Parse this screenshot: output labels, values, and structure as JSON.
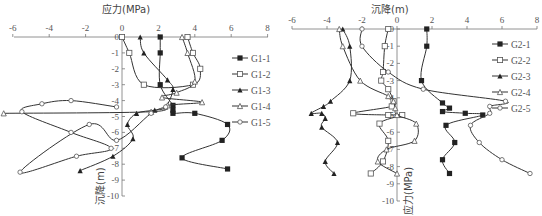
{
  "chart_data": [
    {
      "type": "line",
      "title": "",
      "xlabel": "应力(MPa)",
      "ylabel": "沉降(m)",
      "xlim": [
        -6,
        8
      ],
      "ylim": [
        -10,
        0
      ],
      "xticks": [
        "-6",
        "-4",
        "-2",
        "0",
        "2",
        "4",
        "6",
        "8"
      ],
      "yticks": [
        "0",
        "-1",
        "-2",
        "-3",
        "-4",
        "-5",
        "-6",
        "-7",
        "-8",
        "-9",
        "-10"
      ],
      "grid": false,
      "legend_position": "right",
      "series": [
        {
          "name": "G1-1",
          "marker": "filled-square",
          "points": [
            [
              2.1,
              0
            ],
            [
              2.1,
              -1
            ],
            [
              2.1,
              -3
            ],
            [
              2.8,
              -4.3
            ],
            [
              2.8,
              -4.6
            ],
            [
              2.8,
              -4.8
            ],
            [
              4.0,
              -4.8
            ],
            [
              5.8,
              -5.5
            ],
            [
              5.5,
              -6.5
            ],
            [
              3.3,
              -7.6
            ],
            [
              5.8,
              -8.3
            ]
          ]
        },
        {
          "name": "G1-2",
          "marker": "open-square",
          "points": [
            [
              0,
              0
            ],
            [
              0.4,
              -1
            ],
            [
              1.2,
              -3
            ],
            [
              3.9,
              -3
            ],
            [
              4.3,
              -2
            ],
            [
              3.9,
              -1
            ],
            [
              3.6,
              0
            ]
          ]
        },
        {
          "name": "G1-3",
          "marker": "filled-triangle",
          "points": [
            [
              1.0,
              0
            ],
            [
              1.2,
              -1
            ],
            [
              2.5,
              -2.7
            ],
            [
              2.8,
              -3.3
            ],
            [
              2.4,
              -4.4
            ],
            [
              1.8,
              -4.6
            ],
            [
              0.8,
              -4.8
            ],
            [
              0.3,
              -5.5
            ],
            [
              0.6,
              -6.4
            ],
            [
              -0.5,
              -7.5
            ],
            [
              -2.3,
              -8.4
            ]
          ]
        },
        {
          "name": "G1-4",
          "marker": "open-triangle",
          "points": [
            [
              3.3,
              0
            ],
            [
              3.6,
              -1
            ],
            [
              4.0,
              -2.8
            ],
            [
              3.0,
              -3.5
            ],
            [
              2.2,
              -3.8
            ],
            [
              4.4,
              -4.1
            ],
            [
              2.5,
              -4.3
            ],
            [
              1.6,
              -4.7
            ],
            [
              -6.5,
              -4.8
            ]
          ]
        },
        {
          "name": "G1-5",
          "marker": "open-circle",
          "points": [
            [
              -0.3,
              -4.4
            ],
            [
              -2.8,
              -4.0
            ],
            [
              -4.4,
              -4.2
            ],
            [
              -5.5,
              -4.7
            ],
            [
              -2.8,
              -6.0
            ],
            [
              -0.6,
              -7.0
            ],
            [
              -2.5,
              -7.5
            ],
            [
              -5.6,
              -8.5
            ],
            [
              -1.8,
              -5.5
            ],
            [
              -0.3,
              -6.5
            ],
            [
              1.6,
              -4.8
            ],
            [
              2.4,
              -4.4
            ]
          ]
        }
      ]
    },
    {
      "type": "line",
      "title": "",
      "xlabel": "沉降(m)",
      "ylabel": "应力(MPa)",
      "xlim": [
        -6,
        8
      ],
      "ylim": [
        -10,
        0
      ],
      "xticks": [
        "-6",
        "-4",
        "-2",
        "0",
        "2",
        "4",
        "6",
        "8"
      ],
      "yticks": [
        "0",
        "-1",
        "-2",
        "-3",
        "-4",
        "-5",
        "-6",
        "-7",
        "-8",
        "-9",
        "-10"
      ],
      "grid": false,
      "legend_position": "right",
      "series": [
        {
          "name": "G2-1",
          "marker": "filled-square",
          "points": [
            [
              1.7,
              0
            ],
            [
              1.7,
              -1
            ],
            [
              1.4,
              -3
            ],
            [
              2.6,
              -4.3
            ],
            [
              3.0,
              -4.6
            ],
            [
              2.6,
              -4.8
            ],
            [
              3.9,
              -4.9
            ],
            [
              4.9,
              -5.0
            ],
            [
              2.8,
              -5.6
            ],
            [
              3.3,
              -6.6
            ],
            [
              2.6,
              -7.6
            ],
            [
              3.0,
              -8.4
            ]
          ]
        },
        {
          "name": "G2-2",
          "marker": "open-square",
          "points": [
            [
              -0.5,
              0
            ],
            [
              -0.7,
              -1
            ],
            [
              -0.8,
              -2.5
            ],
            [
              -0.9,
              -3.0
            ],
            [
              -0.5,
              -3.5
            ],
            [
              -0.2,
              -4.2
            ],
            [
              -0.3,
              -4.5
            ],
            [
              -2.5,
              -4.9
            ],
            [
              -0.5,
              -5.0
            ],
            [
              0.3,
              -5.0
            ],
            [
              -1.0,
              -5.5
            ],
            [
              -0.5,
              -6.5
            ],
            [
              -0.8,
              -7.7
            ],
            [
              -1.5,
              -8.4
            ]
          ]
        },
        {
          "name": "G2-3",
          "marker": "filled-triangle",
          "points": [
            [
              -3.1,
              0
            ],
            [
              -2.7,
              -1
            ],
            [
              -2.7,
              -3
            ],
            [
              -3.8,
              -4.2
            ],
            [
              -4.2,
              -4.5
            ],
            [
              -4.9,
              -4.9
            ],
            [
              -4.3,
              -4.9
            ],
            [
              -4.1,
              -5.2
            ],
            [
              -4.3,
              -5.7
            ],
            [
              -3.4,
              -6.6
            ],
            [
              -4.1,
              -7.7
            ],
            [
              -3.6,
              -8.4
            ]
          ]
        },
        {
          "name": "G2-4",
          "marker": "open-triangle",
          "points": [
            [
              -3.3,
              0
            ],
            [
              -3.1,
              -1
            ],
            [
              -2.1,
              -3
            ],
            [
              -0.5,
              -3.9
            ],
            [
              -0.2,
              -4.2
            ],
            [
              -0.1,
              -4.6
            ],
            [
              0,
              -5.0
            ],
            [
              1.1,
              -5.5
            ],
            [
              1.0,
              -6.5
            ],
            [
              -0.6,
              -7.0
            ],
            [
              -1.1,
              -7.7
            ],
            [
              0,
              -8.4
            ]
          ]
        },
        {
          "name": "G2-5",
          "marker": "open-circle",
          "points": [
            [
              -2.0,
              0
            ],
            [
              -2.0,
              -1
            ],
            [
              -0.5,
              -2.5
            ],
            [
              1.5,
              -3.5
            ],
            [
              6.2,
              -4.2
            ],
            [
              5.3,
              -4.5
            ],
            [
              5.3,
              -4.9
            ],
            [
              4.2,
              -5.6
            ],
            [
              4.7,
              -6.6
            ],
            [
              6.0,
              -7.6
            ],
            [
              7.6,
              -8.4
            ]
          ]
        }
      ]
    }
  ],
  "charts": [
    {
      "xlabel": "应力(MPa)",
      "ylabel": "沉降(m)",
      "legend": [
        "G1-1",
        "G1-2",
        "G1-3",
        "G1-4",
        "G1-5"
      ]
    },
    {
      "xlabel": "沉降(m)",
      "ylabel": "应力(MPa)",
      "legend": [
        "G2-1",
        "G2-2",
        "G2-3",
        "G2-4",
        "G2-5"
      ]
    }
  ],
  "ticks": {
    "x": [
      "-6",
      "-4",
      "-2",
      "0",
      "2",
      "4",
      "6",
      "8"
    ],
    "y": [
      "0",
      "-1",
      "-2",
      "-3",
      "-4",
      "-5",
      "-6",
      "-7",
      "-8",
      "-9",
      "-10"
    ]
  }
}
